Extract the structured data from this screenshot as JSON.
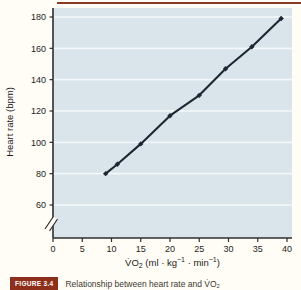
{
  "page": {
    "background": "#fffdf6",
    "top_rule_color": "#8a3a28"
  },
  "chart_data": {
    "type": "line",
    "title": "",
    "xlabel": "V̇O₂ (ml · kg⁻¹ · min⁻¹)",
    "ylabel": "Heart rate (bpm)",
    "x": [
      9,
      11,
      15,
      20,
      25,
      29.5,
      34,
      39
    ],
    "y": [
      80,
      86,
      99,
      117,
      130,
      147,
      161,
      179
    ],
    "xlim": [
      0,
      40
    ],
    "ylim": [
      60,
      180
    ],
    "x_ticks": [
      0,
      5,
      10,
      15,
      20,
      25,
      30,
      35,
      40
    ],
    "y_ticks": [
      60,
      80,
      100,
      120,
      140,
      160,
      180
    ],
    "y_axis_break": true,
    "grid": "horizontal",
    "legend": "none",
    "panel_color": "#d9e5eb",
    "grid_color": "#f4f8f9",
    "line_color": "#1d2733",
    "axis_color": "#2e2e2e",
    "marker": "diamond"
  },
  "xlabel_parts": {
    "p1": "V̇O",
    "p2": "2",
    "p3": " (ml · kg",
    "p4": "−1",
    "p5": " · min",
    "p6": "−1",
    "p7": ")"
  },
  "caption": {
    "badge_label": "FIGURE 3.4",
    "badge_color": "#8e2f1c",
    "text": "Relationship between heart rate and V̇O₂"
  }
}
